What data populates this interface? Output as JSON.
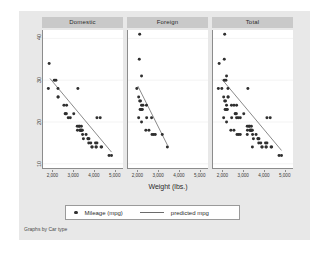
{
  "chart_data": {
    "type": "scatter",
    "title": "",
    "xlabel": "Weight (lbs.)",
    "ylabel": "",
    "note": "Graphs by Car type",
    "xlim": [
      1500,
      5400
    ],
    "ylim": [
      9,
      42
    ],
    "xticks": [
      2000,
      3000,
      4000,
      5000
    ],
    "xticklabels": [
      "2,000",
      "3,000",
      "4,000",
      "5,000"
    ],
    "yticks": [
      10,
      20,
      30,
      40
    ],
    "yticklabels": [
      "10",
      "20",
      "30",
      "40"
    ],
    "grid": true,
    "grid_axis": "y",
    "legend_position": "bottom",
    "marker_color": "#2f2f2f",
    "line_color": "#6b6b6b",
    "panel_header_color": "#c9c9c9",
    "plot_background": "#ffffff",
    "figure_background": "#e8e8e8",
    "legend": [
      {
        "name": "Mileage (mpg)",
        "symbol": "marker"
      },
      {
        "name": "predicted mpg",
        "symbol": "line"
      }
    ],
    "panels": [
      {
        "label": "Domestic",
        "points": [
          [
            1800,
            34
          ],
          [
            1760,
            28
          ],
          [
            2050,
            30
          ],
          [
            2130,
            30
          ],
          [
            2230,
            28
          ],
          [
            2230,
            26
          ],
          [
            2240,
            26
          ],
          [
            2520,
            24
          ],
          [
            2580,
            22
          ],
          [
            2600,
            22
          ],
          [
            2640,
            22
          ],
          [
            2650,
            24
          ],
          [
            2730,
            21
          ],
          [
            2830,
            21
          ],
          [
            3000,
            22
          ],
          [
            3170,
            19
          ],
          [
            3180,
            18
          ],
          [
            3200,
            28
          ],
          [
            3250,
            19
          ],
          [
            3280,
            19
          ],
          [
            3300,
            18
          ],
          [
            3310,
            18
          ],
          [
            3350,
            18
          ],
          [
            3360,
            18
          ],
          [
            3370,
            19
          ],
          [
            3380,
            18
          ],
          [
            3420,
            18
          ],
          [
            3430,
            17
          ],
          [
            3470,
            16
          ],
          [
            3600,
            17
          ],
          [
            3690,
            16
          ],
          [
            3700,
            16
          ],
          [
            3730,
            15
          ],
          [
            3740,
            16
          ],
          [
            3830,
            15
          ],
          [
            3880,
            14
          ],
          [
            3900,
            14
          ],
          [
            4060,
            15
          ],
          [
            4080,
            14
          ],
          [
            4100,
            14
          ],
          [
            4130,
            21
          ],
          [
            4290,
            21
          ],
          [
            4330,
            14
          ],
          [
            4360,
            14
          ],
          [
            4130,
            15
          ],
          [
            4720,
            12
          ],
          [
            4840,
            12
          ]
        ],
        "fit_line": [
          [
            1840,
            30.4
          ],
          [
            4840,
            12.8
          ]
        ]
      },
      {
        "label": "Foreign",
        "points": [
          [
            2070,
            41
          ],
          [
            2050,
            35
          ],
          [
            2160,
            31
          ],
          [
            1930,
            28
          ],
          [
            2020,
            26
          ],
          [
            2070,
            25
          ],
          [
            2110,
            25
          ],
          [
            2160,
            24
          ],
          [
            2230,
            24
          ],
          [
            2090,
            23
          ],
          [
            2130,
            23
          ],
          [
            2150,
            23
          ],
          [
            2200,
            23
          ],
          [
            2400,
            24
          ],
          [
            2020,
            21
          ],
          [
            2410,
            21
          ],
          [
            2650,
            21
          ],
          [
            2160,
            20
          ],
          [
            2370,
            18
          ],
          [
            2520,
            18
          ],
          [
            2670,
            17
          ],
          [
            2750,
            17
          ],
          [
            2830,
            17
          ],
          [
            3170,
            17
          ],
          [
            3420,
            14
          ]
        ],
        "fit_line": [
          [
            1980,
            28.6
          ],
          [
            3430,
            14.4
          ]
        ]
      },
      {
        "label": "Total",
        "points": [
          [
            2070,
            41
          ],
          [
            1800,
            34
          ],
          [
            2050,
            35
          ],
          [
            1760,
            28
          ],
          [
            1930,
            28
          ],
          [
            2050,
            30
          ],
          [
            2130,
            30
          ],
          [
            2160,
            31
          ],
          [
            2230,
            28
          ],
          [
            2020,
            26
          ],
          [
            2070,
            25
          ],
          [
            2110,
            25
          ],
          [
            2160,
            24
          ],
          [
            2230,
            26
          ],
          [
            2240,
            26
          ],
          [
            2090,
            23
          ],
          [
            2130,
            23
          ],
          [
            2150,
            23
          ],
          [
            2200,
            23
          ],
          [
            2400,
            24
          ],
          [
            2520,
            24
          ],
          [
            2580,
            22
          ],
          [
            2600,
            22
          ],
          [
            2640,
            22
          ],
          [
            2650,
            24
          ],
          [
            2020,
            21
          ],
          [
            2410,
            21
          ],
          [
            2650,
            21
          ],
          [
            2160,
            20
          ],
          [
            2730,
            21
          ],
          [
            2830,
            21
          ],
          [
            3000,
            22
          ],
          [
            2370,
            18
          ],
          [
            2520,
            18
          ],
          [
            2670,
            17
          ],
          [
            2750,
            17
          ],
          [
            2830,
            17
          ],
          [
            3170,
            19
          ],
          [
            3170,
            17
          ],
          [
            3180,
            18
          ],
          [
            3200,
            28
          ],
          [
            3250,
            19
          ],
          [
            3280,
            19
          ],
          [
            3300,
            18
          ],
          [
            3310,
            18
          ],
          [
            3350,
            18
          ],
          [
            3360,
            18
          ],
          [
            3370,
            19
          ],
          [
            3380,
            18
          ],
          [
            3420,
            18
          ],
          [
            3420,
            14
          ],
          [
            3430,
            17
          ],
          [
            3470,
            16
          ],
          [
            3600,
            17
          ],
          [
            3690,
            16
          ],
          [
            3700,
            16
          ],
          [
            3730,
            15
          ],
          [
            3740,
            16
          ],
          [
            3830,
            15
          ],
          [
            3880,
            14
          ],
          [
            3900,
            14
          ],
          [
            4060,
            15
          ],
          [
            4080,
            14
          ],
          [
            4100,
            14
          ],
          [
            4130,
            21
          ],
          [
            4290,
            21
          ],
          [
            4330,
            14
          ],
          [
            4360,
            14
          ],
          [
            4130,
            15
          ],
          [
            4720,
            12
          ],
          [
            4840,
            12
          ]
        ],
        "fit_line": [
          [
            1940,
            30.2
          ],
          [
            4840,
            13.2
          ]
        ]
      }
    ]
  }
}
